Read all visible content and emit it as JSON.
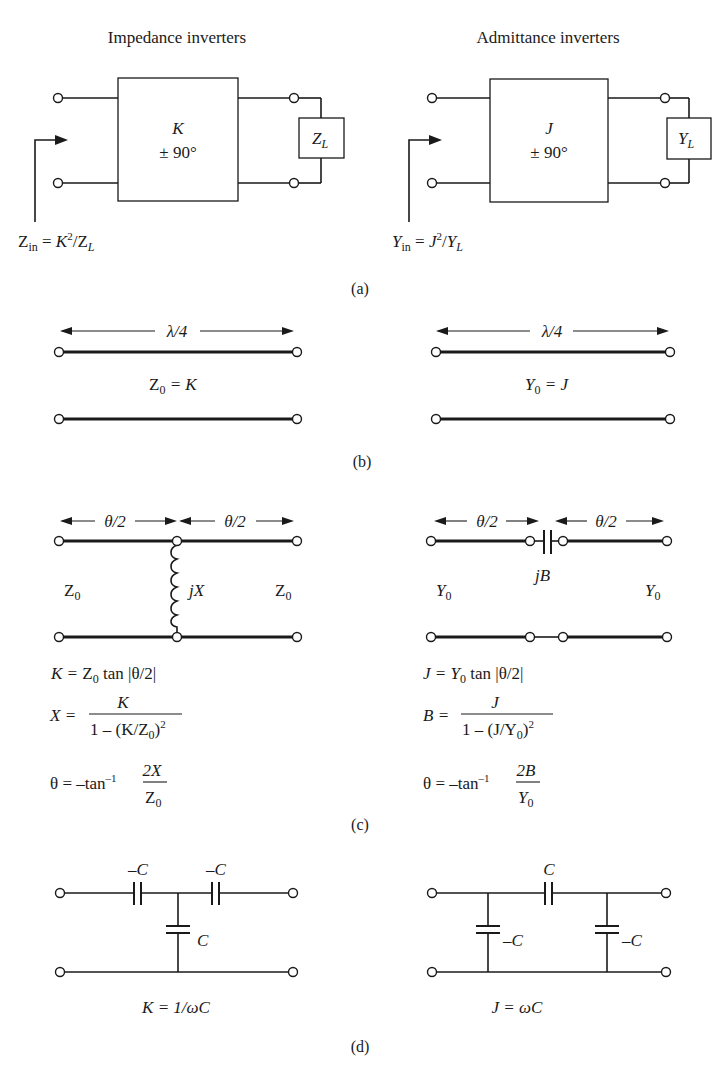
{
  "section_a": {
    "caption": "(a)",
    "impedance": {
      "title": "Impedance inverters",
      "param": "K",
      "phase": "± 90°",
      "load_main": "Z",
      "load_sub": "L",
      "input_main": "Z",
      "input_sub": "in",
      "input_eq": " = ",
      "input_param": "K",
      "input_exp": "2",
      "input_slash": "/",
      "input_load_main": "Z",
      "input_load_sub": "L"
    },
    "admittance": {
      "title": "Admittance inverters",
      "param": "J",
      "phase": "± 90°",
      "load_main": "Y",
      "load_sub": "L",
      "input_main": "Y",
      "input_sub": "in",
      "input_eq": " = ",
      "input_param": "J",
      "input_exp": "2",
      "input_slash": "/",
      "input_load_main": "Y",
      "input_load_sub": "L"
    }
  },
  "section_b": {
    "caption": "(b)",
    "impedance": {
      "length_label": "λ/4",
      "eq_main": "Z",
      "eq_sub": "0",
      "eq_rest": " = K"
    },
    "admittance": {
      "length_label": "λ/4",
      "eq_main": "Y",
      "eq_sub": "0",
      "eq_rest": " = J"
    }
  },
  "section_c": {
    "caption": "(c)",
    "impedance": {
      "half_len_left": "θ/2",
      "half_len_right": "θ/2",
      "element_label": "jX",
      "char_left_main": "Z",
      "char_left_sub": "0",
      "char_right_main": "Z",
      "char_right_sub": "0",
      "eq1_lhs": "K = ",
      "eq1_z": "Z",
      "eq1_zsub": "0",
      "eq1_rest": " tan |θ/2|",
      "eq2_lhs": "X = ",
      "eq2_num": "K",
      "eq2_den_a": "1 – (K/Z",
      "eq2_den_sub": "0",
      "eq2_den_b": ")",
      "eq2_den_exp": "2",
      "eq3_lhs": "θ = –tan",
      "eq3_exp": "–1",
      "eq3_num": "2X",
      "eq3_den_main": "Z",
      "eq3_den_sub": "0"
    },
    "admittance": {
      "half_len_left": "θ/2",
      "half_len_right": "θ/2",
      "element_label": "jB",
      "char_left_main": "Y",
      "char_left_sub": "0",
      "char_right_main": "Y",
      "char_right_sub": "0",
      "eq1_lhs": "J = ",
      "eq1_y": "Y",
      "eq1_ysub": "0",
      "eq1_rest": " tan |θ/2|",
      "eq2_lhs": "B = ",
      "eq2_num": "J",
      "eq2_den_a": "1 – (J/Y",
      "eq2_den_sub": "0",
      "eq2_den_b": ")",
      "eq2_den_exp": "2",
      "eq3_lhs": "θ = –tan",
      "eq3_exp": "–1",
      "eq3_num": "2B",
      "eq3_den_main": "Y",
      "eq3_den_sub": "0"
    }
  },
  "section_d": {
    "caption": "(d)",
    "impedance": {
      "series_left_label": "–C",
      "series_right_label": "–C",
      "shunt_label": "C",
      "equation": "K = 1/ωC"
    },
    "admittance": {
      "series_label": "C",
      "shunt_left_label": "–C",
      "shunt_right_label": "–C",
      "equation": "J = ωC"
    }
  }
}
